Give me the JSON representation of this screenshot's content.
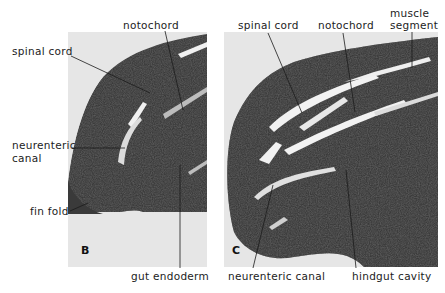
{
  "figure": {
    "panels": [
      {
        "id": "B",
        "letter": "B",
        "labels": {
          "spinal_cord": "spinal cord",
          "notochord": "notochord",
          "neurenteric_canal_line1": "neurenteric",
          "neurenteric_canal_line2": "canal",
          "fin_fold": "fin fold",
          "gut_endoderm": "gut endoderm"
        }
      },
      {
        "id": "C",
        "letter": "C",
        "labels": {
          "spinal_cord": "spinal cord",
          "notochord": "notochord",
          "muscle_segment_line1": "muscle",
          "muscle_segment_line2": "segment",
          "neurenteric_canal": "neurenteric canal",
          "hindgut_cavity": "hindgut cavity"
        }
      }
    ],
    "colors": {
      "tissue": "#2a2a2a",
      "background": "#e6e6e6",
      "cavity": "#f2f2f2",
      "text": "#1c1c1c"
    }
  }
}
